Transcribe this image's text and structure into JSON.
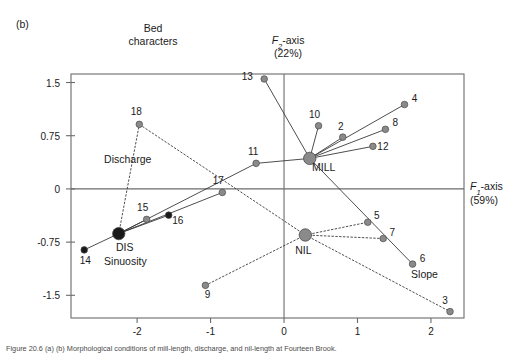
{
  "figure": {
    "panel_label": "(b)",
    "header_line1": "Bed",
    "header_line2": "characters",
    "caption": "Figure 20.6  (a) (b) Morphological conditions of mill-length, discharge, and nil-length at Fourteen Brook."
  },
  "chart_data": {
    "type": "scatter",
    "xlabel": "F1-axis (59%)",
    "ylabel": "F2-axis (22%)",
    "x_axis_title_line1": "F1-axis",
    "x_axis_title_line2": "(59%)",
    "y_axis_title_line1": "F2-axis",
    "y_axis_title_line2": "(22%)",
    "xlim": [
      -2.9,
      2.45
    ],
    "ylim": [
      -1.82,
      1.62
    ],
    "xticks": [
      -2,
      -1,
      0,
      1,
      2
    ],
    "xticklabels": [
      "-2",
      "-1",
      "0",
      "1",
      "2"
    ],
    "yticks": [
      1.5,
      0.75,
      0,
      -0.75,
      -1.5
    ],
    "yticklabels": [
      "1.5",
      "0.75",
      "0",
      "-0.75",
      "-1.5"
    ],
    "grid": false,
    "legend": "none",
    "zero_lines": [
      "x=0",
      "y=0"
    ],
    "zone_labels": [
      {
        "text": "Discharge",
        "x": -2.45,
        "y": 0.36
      },
      {
        "text": "Sinuosity",
        "x": -2.45,
        "y": -1.07
      },
      {
        "text": "Slope",
        "x": 1.73,
        "y": -1.25
      }
    ],
    "centroids": [
      {
        "name": "MILL",
        "x": 0.35,
        "y": 0.43,
        "label_dx": 14,
        "label_dy": 13,
        "marker": "filled-gray-large"
      },
      {
        "name": "NIL",
        "x": 0.29,
        "y": -0.65,
        "label_dx": -2,
        "label_dy": 19,
        "marker": "filled-gray-large"
      },
      {
        "name": "DIS",
        "x": -2.25,
        "y": -0.63,
        "label_dx": 6,
        "label_dy": 17,
        "marker": "filled-black-large"
      }
    ],
    "points": [
      {
        "id": "2",
        "x": 0.8,
        "y": 0.73,
        "group": "MILL",
        "marker": "gray",
        "label_dx": -2,
        "label_dy": -7
      },
      {
        "id": "4",
        "x": 1.64,
        "y": 1.19,
        "group": "MILL",
        "marker": "gray",
        "label_dx": 10,
        "label_dy": -3
      },
      {
        "id": "8",
        "x": 1.38,
        "y": 0.84,
        "group": "MILL",
        "marker": "gray",
        "label_dx": 10,
        "label_dy": -3
      },
      {
        "id": "10",
        "x": 0.47,
        "y": 0.89,
        "group": "MILL",
        "marker": "gray",
        "label_dx": -4,
        "label_dy": -8
      },
      {
        "id": "11",
        "x": -0.38,
        "y": 0.36,
        "group": "MILL",
        "marker": "gray",
        "label_dx": -3,
        "label_dy": -8
      },
      {
        "id": "12",
        "x": 1.21,
        "y": 0.6,
        "group": "MILL",
        "marker": "gray",
        "label_dx": 10,
        "label_dy": 4
      },
      {
        "id": "13",
        "x": -0.27,
        "y": 1.55,
        "group": "MILL",
        "marker": "gray",
        "label_dx": -17,
        "label_dy": 1
      },
      {
        "id": "6",
        "x": 1.75,
        "y": -1.06,
        "group": "MILL",
        "marker": "gray",
        "label_dx": 10,
        "label_dy": -2
      },
      {
        "id": "14",
        "x": -2.72,
        "y": -0.86,
        "group": "DIS",
        "marker": "black",
        "label_dx": 1,
        "label_dy": 14
      },
      {
        "id": "15",
        "x": -1.87,
        "y": -0.43,
        "group": "DIS",
        "marker": "gray",
        "label_dx": -4,
        "label_dy": -8
      },
      {
        "id": "16",
        "x": -1.57,
        "y": -0.37,
        "group": "DIS",
        "marker": "black",
        "label_dx": 9,
        "label_dy": 9
      },
      {
        "id": "17",
        "x": -0.84,
        "y": -0.05,
        "group": "DIS",
        "marker": "gray",
        "label_dx": -4,
        "label_dy": -8
      },
      {
        "id": "18",
        "x": -1.97,
        "y": 0.91,
        "group": "DIS",
        "marker": "gray",
        "label_dx": -3,
        "label_dy": -9
      },
      {
        "id": "3",
        "x": 2.26,
        "y": -1.73,
        "group": "NIL",
        "marker": "gray",
        "label_dx": -5,
        "label_dy": -8
      },
      {
        "id": "5",
        "x": 1.14,
        "y": -0.47,
        "group": "NIL",
        "marker": "gray",
        "label_dx": 9,
        "label_dy": -3
      },
      {
        "id": "7",
        "x": 1.35,
        "y": -0.7,
        "group": "NIL",
        "marker": "gray",
        "label_dx": 9,
        "label_dy": -3
      },
      {
        "id": "9",
        "x": -1.07,
        "y": -1.36,
        "group": "NIL",
        "marker": "gray",
        "label_dx": 2,
        "label_dy": 13
      }
    ],
    "spokes": [
      {
        "from": "MILL",
        "to": "2",
        "style": "solid"
      },
      {
        "from": "MILL",
        "to": "4",
        "style": "solid"
      },
      {
        "from": "MILL",
        "to": "8",
        "style": "solid"
      },
      {
        "from": "MILL",
        "to": "10",
        "style": "solid"
      },
      {
        "from": "MILL",
        "to": "11",
        "style": "solid"
      },
      {
        "from": "MILL",
        "to": "12",
        "style": "solid"
      },
      {
        "from": "MILL",
        "to": "13",
        "style": "solid"
      },
      {
        "from": "MILL",
        "to": "6",
        "style": "solid"
      },
      {
        "from": "DIS",
        "to": "14",
        "style": "solid"
      },
      {
        "from": "DIS",
        "to": "15",
        "style": "solid"
      },
      {
        "from": "DIS",
        "to": "16",
        "style": "solid"
      },
      {
        "from": "DIS",
        "to": "17",
        "style": "solid"
      },
      {
        "from": "DIS",
        "to": "11",
        "style": "solid"
      },
      {
        "from": "DIS",
        "to": "18",
        "style": "dotted"
      },
      {
        "from": "NIL",
        "to": "3",
        "style": "dotted"
      },
      {
        "from": "NIL",
        "to": "5",
        "style": "dotted"
      },
      {
        "from": "NIL",
        "to": "7",
        "style": "dotted"
      },
      {
        "from": "NIL",
        "to": "9",
        "style": "dotted"
      },
      {
        "from": "NIL",
        "to": "18",
        "style": "dotted"
      }
    ]
  },
  "colors": {
    "frame": "#6b6b6b",
    "axis_line": "#6b6b6b",
    "point_gray": "#8a8a8a",
    "point_black": "#1a1a1a",
    "text": "#1a1a1a",
    "line": "#3a3a3a"
  }
}
